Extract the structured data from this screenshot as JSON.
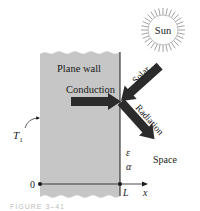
{
  "diagram": {
    "wall_label": "Plane wall",
    "conduction_label": "Conduction",
    "solar_label": "Solar",
    "radiation_label": "Radiation",
    "sun_label": "Sun",
    "space_label": "Space",
    "emissivity_symbol": "ε",
    "absorptivity_symbol": "α",
    "temperature_label": "T",
    "temperature_subscript": "1",
    "origin_label": "0",
    "thickness_label": "L",
    "axis_label": "x",
    "caption": "FIGURE 3–41"
  },
  "colors": {
    "wall_fill": "#c6c6c6",
    "arrow": "#2b2b2b",
    "line": "#1a1a1a",
    "sun_rays": "#8a8a8a"
  }
}
